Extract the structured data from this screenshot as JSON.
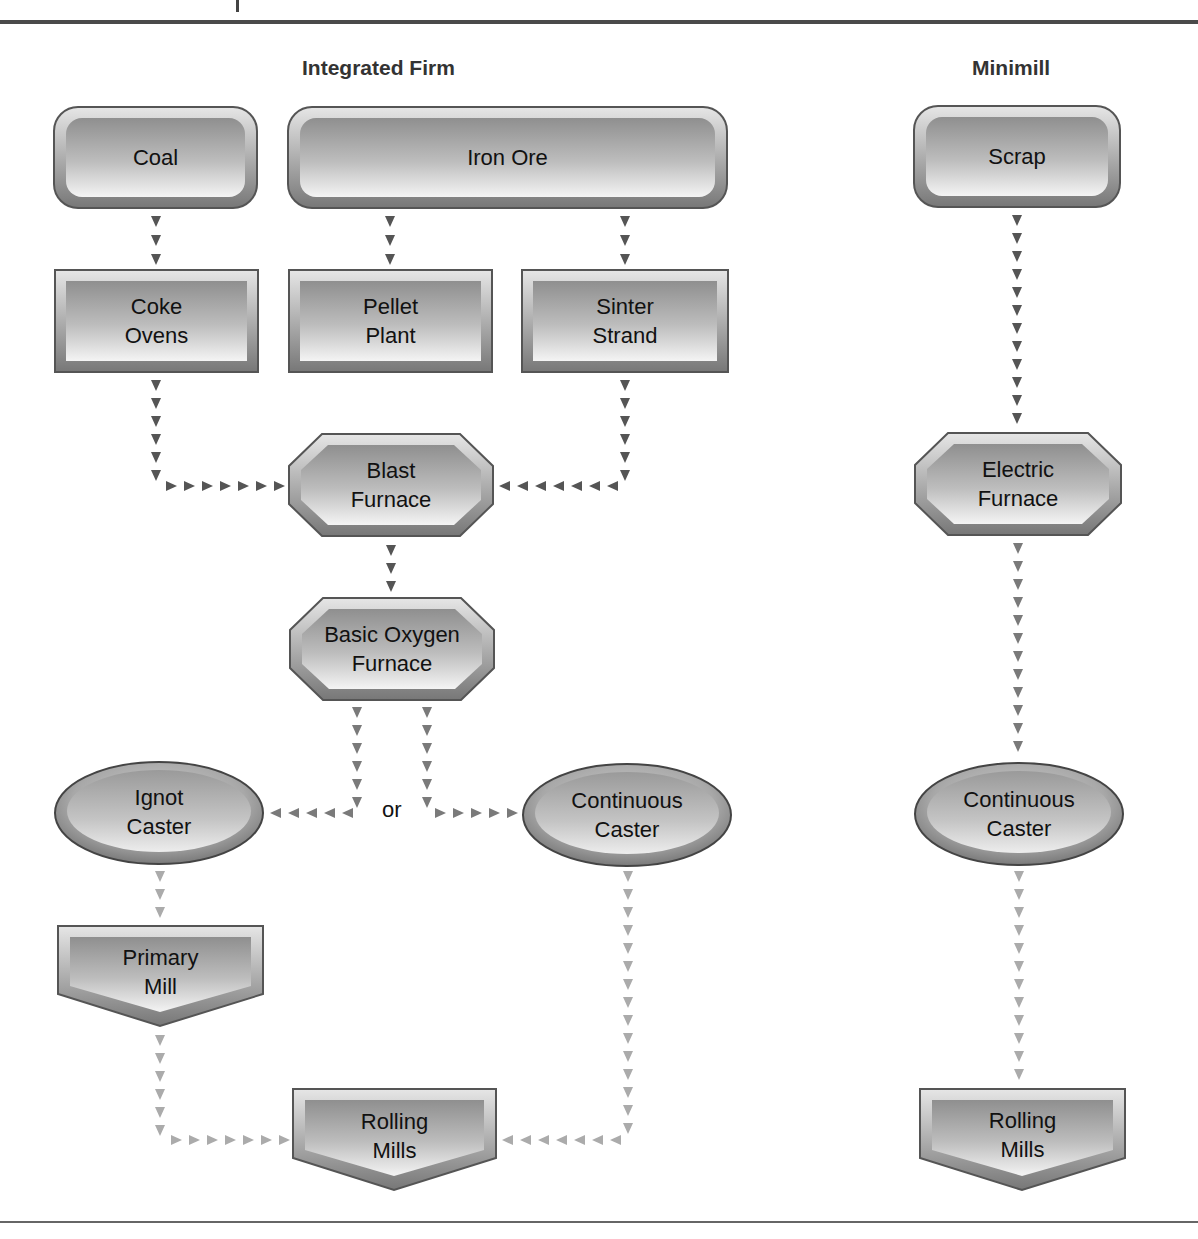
{
  "sections": {
    "integrated": {
      "title": "Integrated Firm"
    },
    "minimill": {
      "title": "Minimill"
    }
  },
  "nodes": {
    "coal": {
      "label": "Coal",
      "shape": "rounded-rect"
    },
    "iron_ore": {
      "label": "Iron Ore",
      "shape": "rounded-rect"
    },
    "coke_ovens": {
      "label": "Coke\nOvens",
      "shape": "rect"
    },
    "pellet_plant": {
      "label": "Pellet\nPlant",
      "shape": "rect"
    },
    "sinter_strand": {
      "label": "Sinter\nStrand",
      "shape": "rect"
    },
    "blast_furnace": {
      "label": "Blast\nFurnace",
      "shape": "octagon"
    },
    "bof": {
      "label": "Basic Oxygen\nFurnace",
      "shape": "octagon"
    },
    "ingot_caster": {
      "label": "Ignot\nCaster",
      "shape": "ellipse"
    },
    "continuous_caster_int": {
      "label": "Continuous\nCaster",
      "shape": "ellipse"
    },
    "primary_mill": {
      "label": "Primary\nMill",
      "shape": "pentagon-down"
    },
    "rolling_mills_int": {
      "label": "Rolling\nMills",
      "shape": "pentagon-down"
    },
    "scrap": {
      "label": "Scrap",
      "shape": "rounded-rect"
    },
    "electric_furnace": {
      "label": "Electric\nFurnace",
      "shape": "octagon"
    },
    "continuous_caster_mini": {
      "label": "Continuous\nCaster",
      "shape": "ellipse"
    },
    "rolling_mills_mini": {
      "label": "Rolling\nMills",
      "shape": "pentagon-down"
    }
  },
  "connector": {
    "or_label": "or"
  },
  "edges": [
    {
      "from": "coal",
      "to": "coke_ovens"
    },
    {
      "from": "iron_ore",
      "to": "pellet_plant"
    },
    {
      "from": "iron_ore",
      "to": "sinter_strand"
    },
    {
      "from": "coke_ovens",
      "to": "blast_furnace"
    },
    {
      "from": "sinter_strand",
      "to": "blast_furnace"
    },
    {
      "from": "blast_furnace",
      "to": "bof"
    },
    {
      "from": "bof",
      "to": "ingot_caster"
    },
    {
      "from": "bof",
      "to": "continuous_caster_int"
    },
    {
      "from": "ingot_caster",
      "to": "primary_mill"
    },
    {
      "from": "primary_mill",
      "to": "rolling_mills_int"
    },
    {
      "from": "continuous_caster_int",
      "to": "rolling_mills_int"
    },
    {
      "from": "scrap",
      "to": "electric_furnace"
    },
    {
      "from": "electric_furnace",
      "to": "continuous_caster_mini"
    },
    {
      "from": "continuous_caster_mini",
      "to": "rolling_mills_mini"
    }
  ],
  "colors": {
    "arrow_dark": "#555555",
    "arrow_light": "#b0b0b0",
    "node_border": "#555555",
    "node_fill_light": "#f2f2f2",
    "node_fill_dark": "#8c8c8c"
  }
}
